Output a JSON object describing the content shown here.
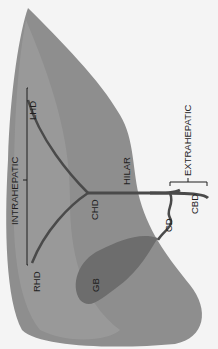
{
  "diagram": {
    "labels": {
      "intrahepatic": "INTRAHEPATIC",
      "extrahepatic": "EXTRAHEPATIC",
      "lhd": "LHD",
      "rhd": "RHD",
      "chd": "CHD",
      "hilar": "HILAR",
      "cd": "CD",
      "cbd": "CBD",
      "gb": "GB"
    },
    "colors": {
      "background": "#f4f4f4",
      "liver": "#8e8e8e",
      "liver_light": "#a9a9a9",
      "gallbladder": "#6d6d6d",
      "duct": "#4a4a4a",
      "text": "#1e1e1e"
    }
  }
}
